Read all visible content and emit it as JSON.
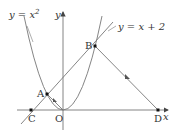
{
  "diagram": {
    "type": "coordinate-geometry",
    "axes": {
      "x_label": "x",
      "y_label": "y",
      "origin_label": "O"
    },
    "curves": [
      {
        "name": "parabola",
        "equation": "y = x^2",
        "label": "y = x²"
      },
      {
        "name": "line",
        "equation": "y = x + 2",
        "label": "y = x + 2"
      }
    ],
    "points": [
      {
        "label": "A",
        "coords": [
          -1,
          1
        ],
        "description": "left intersection of parabola and line"
      },
      {
        "label": "B",
        "coords": [
          2,
          4
        ],
        "description": "right intersection of parabola and line"
      },
      {
        "label": "C",
        "coords": [
          -2,
          0
        ],
        "description": "line meets x-axis"
      },
      {
        "label": "D",
        "coords": [
          6,
          0
        ],
        "description": "on x-axis, BD parallel to AO"
      },
      {
        "label": "O",
        "coords": [
          0,
          0
        ],
        "description": "origin"
      }
    ],
    "segments": [
      {
        "from": "A",
        "to": "O",
        "mark": "parallel-arrow"
      },
      {
        "from": "B",
        "to": "D",
        "mark": "parallel-arrow"
      }
    ],
    "colors": {
      "stroke": "#666666",
      "text": "#333333",
      "point": "#111111"
    }
  },
  "labels": {
    "parabola": "y = x",
    "parabola_exp": "2",
    "line": "y = x + 2",
    "x_axis": "x",
    "y_axis": "y",
    "A": "A",
    "B": "B",
    "C": "C",
    "D": "D",
    "O": "O"
  }
}
